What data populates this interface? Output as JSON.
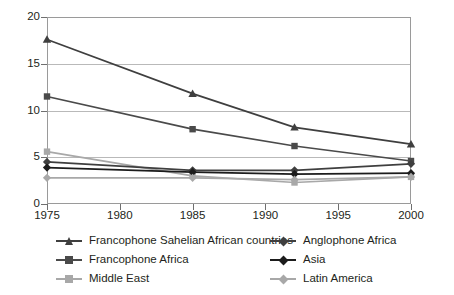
{
  "chart_data": {
    "type": "line",
    "title": "",
    "xlabel": "",
    "ylabel": "",
    "x": [
      1975,
      1985,
      1992,
      2000
    ],
    "xlim": [
      1975,
      2000
    ],
    "ylim": [
      0,
      20
    ],
    "x_ticks": [
      "1975",
      "1980",
      "1985",
      "1990",
      "1995",
      "2000"
    ],
    "x_tick_values": [
      1975,
      1980,
      1985,
      1990,
      1995,
      2000
    ],
    "y_ticks": [
      "0",
      "5",
      "10",
      "15",
      "20"
    ],
    "y_tick_values": [
      0,
      5,
      10,
      15,
      20
    ],
    "grid": "horizontal",
    "legend_position": "bottom",
    "legend_columns": 2,
    "series": [
      {
        "name": "Francophone Sahelian African countries",
        "marker": "triangle",
        "color": "#3f3f3f",
        "values": [
          17.6,
          11.8,
          8.2,
          6.4
        ]
      },
      {
        "name": "Francophone Africa",
        "marker": "square",
        "color": "#4a4a4a",
        "values": [
          11.5,
          8.0,
          6.2,
          4.6
        ]
      },
      {
        "name": "Middle East",
        "marker": "square",
        "color": "#a8a8a8",
        "values": [
          5.6,
          3.0,
          2.3,
          2.9
        ]
      },
      {
        "name": "Anglophone Africa",
        "marker": "diamond",
        "color": "#3f3f3f",
        "values": [
          4.5,
          3.6,
          3.6,
          4.3
        ]
      },
      {
        "name": "Asia",
        "marker": "diamond",
        "color": "#1c1c1c",
        "values": [
          3.9,
          3.4,
          3.2,
          3.3
        ]
      },
      {
        "name": "Latin America",
        "marker": "diamond",
        "color": "#a8a8a8",
        "values": [
          2.8,
          2.8,
          2.6,
          2.9
        ]
      }
    ]
  },
  "legend": {
    "items": [
      {
        "label": "Francophone Sahelian African countries",
        "marker": "triangle",
        "color": "#3f3f3f"
      },
      {
        "label": "Anglophone Africa",
        "marker": "diamond",
        "color": "#3f3f3f"
      },
      {
        "label": "Francophone Africa",
        "marker": "square",
        "color": "#4a4a4a"
      },
      {
        "label": "Asia",
        "marker": "diamond",
        "color": "#1c1c1c"
      },
      {
        "label": "Middle East",
        "marker": "square",
        "color": "#a8a8a8"
      },
      {
        "label": "Latin America",
        "marker": "diamond",
        "color": "#a8a8a8"
      }
    ]
  }
}
